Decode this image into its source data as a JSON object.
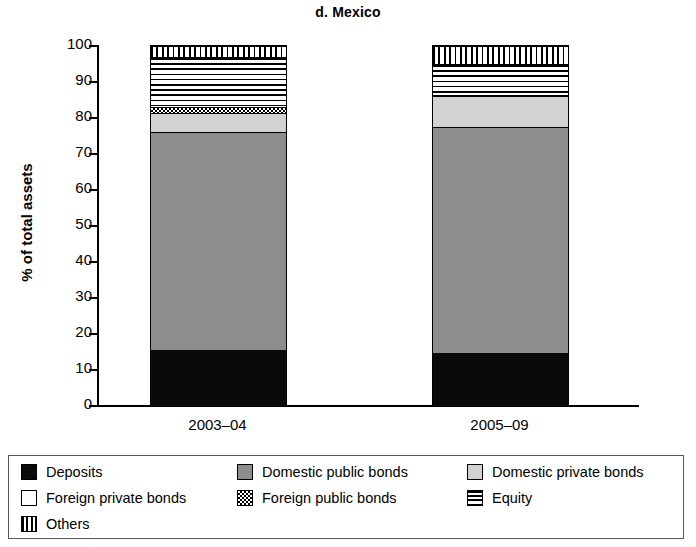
{
  "chart_data": {
    "type": "bar",
    "subtype": "stacked-vertical-100pct",
    "title": "d. Mexico",
    "xlabel": "",
    "ylabel": "% of total assets",
    "ylim": [
      0,
      100
    ],
    "yticks": [
      0,
      10,
      20,
      30,
      40,
      50,
      60,
      70,
      80,
      90,
      100
    ],
    "ytick_labels": [
      "0",
      "10",
      "20",
      "30",
      "40",
      "50",
      "60",
      "70",
      "80",
      "90",
      "100"
    ],
    "grid": false,
    "legend_position": "bottom",
    "categories": [
      "2003–04",
      "2005–09"
    ],
    "series": [
      {
        "name": "Deposits",
        "pattern": "solid-black",
        "color": "#0a0a0a",
        "values": [
          15.5,
          14.7
        ]
      },
      {
        "name": "Domestic public bonds",
        "pattern": "dark-gray",
        "color": "#8d8d8d",
        "values": [
          60.5,
          62.8
        ]
      },
      {
        "name": "Domestic private bonds",
        "pattern": "light-gray",
        "color": "#d2d2d2",
        "values": [
          5.5,
          8.5
        ]
      },
      {
        "name": "Foreign private bonds",
        "pattern": "white",
        "color": "#ffffff",
        "values": [
          0.0,
          0.0
        ]
      },
      {
        "name": "Foreign public bonds",
        "pattern": "checker",
        "color": "#ffffff",
        "values": [
          1.5,
          0.5
        ]
      },
      {
        "name": "Equity",
        "pattern": "hstripe",
        "color": "#ffffff",
        "values": [
          14.0,
          8.5
        ]
      },
      {
        "name": "Others",
        "pattern": "vstripe",
        "color": "#ffffff",
        "values": [
          3.0,
          5.0
        ]
      }
    ]
  },
  "legend": {
    "items": [
      {
        "label": "Deposits",
        "swatch": "solid-black"
      },
      {
        "label": "Domestic public bonds",
        "swatch": "dark-gray"
      },
      {
        "label": "Domestic private bonds",
        "swatch": "light-gray"
      },
      {
        "label": "Foreign private bonds",
        "swatch": "white"
      },
      {
        "label": "Foreign public bonds",
        "swatch": "checker"
      },
      {
        "label": "Equity",
        "swatch": "hstripe"
      },
      {
        "label": "Others",
        "swatch": "vstripe"
      }
    ]
  }
}
